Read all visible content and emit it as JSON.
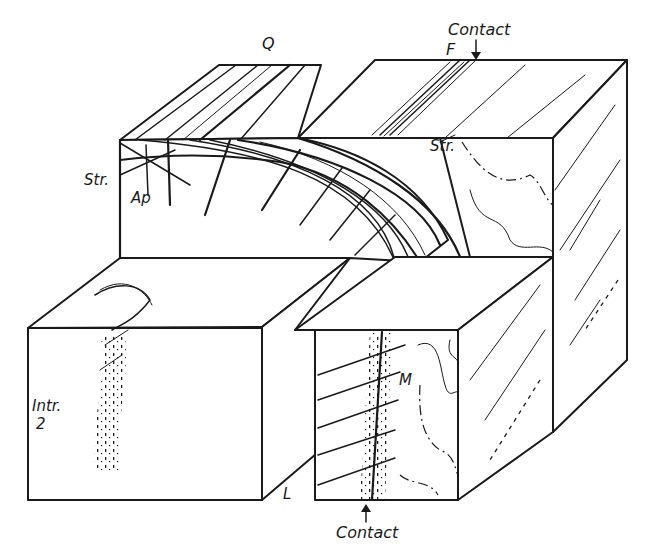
{
  "diagram": {
    "type": "geological block diagram",
    "labels": {
      "q": "Q",
      "f": "F",
      "contact_top": "Contact",
      "contact_bottom": "Contact",
      "str_left": "Str.",
      "str_right": "Str.",
      "ap": "Ap",
      "intr_line1": "Intr.",
      "intr_line2": "2",
      "m": "M",
      "l": "L"
    },
    "arrows": {
      "contact_top_arrow": "↓",
      "contact_bottom_arrow": "↑"
    },
    "colors": {
      "ink": "#1a1a1a",
      "paper": "#ffffff"
    }
  }
}
